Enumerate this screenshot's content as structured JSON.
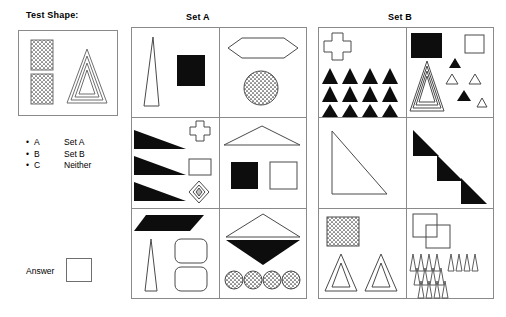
{
  "test": {
    "title": "Test Shape:",
    "shapes": [
      "stippled-rectangle-upper",
      "stippled-rectangle-lower",
      "nested-triangle"
    ]
  },
  "legend": {
    "rows": [
      {
        "bullet": "•",
        "key": "A",
        "value": "Set A"
      },
      {
        "bullet": "•",
        "key": "B",
        "value": "Set B"
      },
      {
        "bullet": "•",
        "key": "C",
        "value": "Neither"
      }
    ]
  },
  "answer": {
    "label": "Answer",
    "value": ""
  },
  "sets": [
    {
      "title": "Set A",
      "cells": [
        {
          "name": "set-a-cell-1",
          "shapes": [
            "thin-tall-triangle-outline",
            "black-square"
          ]
        },
        {
          "name": "set-a-cell-2",
          "shapes": [
            "elongated-hexagon-outline",
            "stippled-circle"
          ]
        },
        {
          "name": "set-a-cell-3",
          "shapes": [
            "black-triangle-wedge",
            "black-triangle-wedge",
            "black-triangle-wedge",
            "cross-outline",
            "square-outline",
            "diamond-nested"
          ]
        },
        {
          "name": "set-a-cell-4",
          "shapes": [
            "wide-flat-triangle-outline",
            "black-square",
            "square-outline"
          ]
        },
        {
          "name": "set-a-cell-5",
          "shapes": [
            "black-parallelogram",
            "thin-tall-triangle-outline",
            "rounded-rect-outline",
            "rounded-rect-outline"
          ]
        },
        {
          "name": "set-a-cell-6",
          "shapes": [
            "white-triangle-up-outline",
            "black-triangle-down",
            "stippled-circle",
            "stippled-circle",
            "stippled-circle",
            "stippled-circle"
          ]
        }
      ]
    },
    {
      "title": "Set B",
      "cells": [
        {
          "name": "set-b-cell-1",
          "shapes": [
            "cross-outline",
            "black-triangle-grid-12"
          ]
        },
        {
          "name": "set-b-cell-2",
          "shapes": [
            "black-square",
            "square-outline",
            "nested-triangle",
            "black-small-triangle",
            "black-small-triangle",
            "white-small-triangle",
            "white-small-triangle",
            "white-small-triangle"
          ]
        },
        {
          "name": "set-b-cell-3",
          "shapes": [
            "right-triangle-outline"
          ]
        },
        {
          "name": "set-b-cell-4",
          "shapes": [
            "black-right-triangle",
            "black-right-triangle",
            "black-right-triangle"
          ]
        },
        {
          "name": "set-b-cell-5",
          "shapes": [
            "stippled-square",
            "nested-triangle",
            "nested-triangle"
          ]
        },
        {
          "name": "set-b-cell-6",
          "shapes": [
            "overlapping-squares-outline",
            "narrow-triangle-cluster"
          ]
        }
      ]
    }
  ],
  "colors": {
    "fill_black": "#0d0d0d",
    "stroke": "#6f6f6f",
    "border": "#8a8a8a",
    "background": "#ffffff"
  }
}
